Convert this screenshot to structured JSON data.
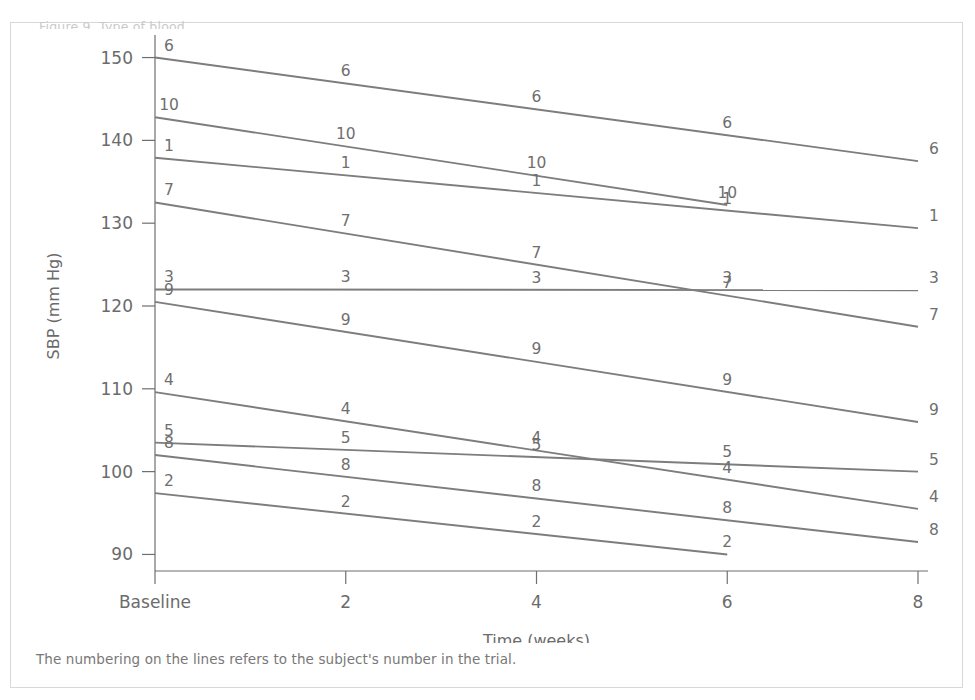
{
  "figure": {
    "top_clipped_caption": "Figure 9. Type of blood",
    "note": "The numbering on the lines refers to the subject's number in the trial."
  },
  "chart_data": {
    "type": "line",
    "title": "",
    "xlabel": "Time (weeks)",
    "ylabel": "SBP (mm Hg)",
    "x": [
      0,
      2,
      4,
      6,
      8
    ],
    "xtick_labels": [
      "Baseline",
      "2",
      "4",
      "6",
      "8"
    ],
    "ytick_labels": [
      "90",
      "100",
      "110",
      "120",
      "130",
      "140",
      "150"
    ],
    "yticks": [
      90,
      100,
      110,
      120,
      130,
      140,
      150
    ],
    "ylim": [
      88,
      152
    ],
    "xlim": [
      0,
      8
    ],
    "grid": false,
    "legend": "none",
    "line_color": "#7d7d7d",
    "label_position": "above-line at each measured x",
    "series": [
      {
        "name": "6",
        "label": "6",
        "x": [
          0,
          8
        ],
        "values": [
          150.0,
          137.5
        ]
      },
      {
        "name": "10",
        "label": "10",
        "x": [
          0,
          6
        ],
        "values": [
          142.8,
          132.2
        ]
      },
      {
        "name": "1",
        "label": "1",
        "x": [
          0,
          8
        ],
        "values": [
          137.9,
          129.4
        ]
      },
      {
        "name": "7",
        "label": "7",
        "x": [
          0,
          8
        ],
        "values": [
          132.5,
          117.5
        ]
      },
      {
        "name": "3",
        "label": "3",
        "x": [
          0,
          8
        ],
        "values": [
          122.0,
          121.9
        ]
      },
      {
        "name": "9",
        "label": "9",
        "x": [
          0,
          8
        ],
        "values": [
          120.5,
          106.0
        ]
      },
      {
        "name": "4",
        "label": "4",
        "x": [
          0,
          8
        ],
        "values": [
          109.6,
          95.5
        ]
      },
      {
        "name": "5",
        "label": "5",
        "x": [
          0,
          8
        ],
        "values": [
          103.5,
          100.0
        ]
      },
      {
        "name": "8",
        "label": "8",
        "x": [
          0,
          8
        ],
        "values": [
          102.0,
          91.5
        ]
      },
      {
        "name": "2",
        "label": "2",
        "x": [
          0,
          6
        ],
        "values": [
          97.4,
          90.0
        ]
      }
    ],
    "point_labels": [
      {
        "series": "6",
        "x": 0,
        "y": 150.0,
        "text": "6"
      },
      {
        "series": "6",
        "x": 2,
        "y": 146.9,
        "text": "6"
      },
      {
        "series": "6",
        "x": 4,
        "y": 143.8,
        "text": "6"
      },
      {
        "series": "6",
        "x": 6,
        "y": 140.6,
        "text": "6"
      },
      {
        "series": "6",
        "x": 8,
        "y": 137.5,
        "text": "6"
      },
      {
        "series": "10",
        "x": 0,
        "y": 142.8,
        "text": "10"
      },
      {
        "series": "10",
        "x": 2,
        "y": 139.3,
        "text": "10"
      },
      {
        "series": "10",
        "x": 4,
        "y": 135.8,
        "text": "10"
      },
      {
        "series": "10",
        "x": 6,
        "y": 132.2,
        "text": "10"
      },
      {
        "series": "1",
        "x": 0,
        "y": 137.9,
        "text": "1"
      },
      {
        "series": "1",
        "x": 2,
        "y": 135.8,
        "text": "1"
      },
      {
        "series": "1",
        "x": 4,
        "y": 133.7,
        "text": "1"
      },
      {
        "series": "1",
        "x": 6,
        "y": 131.5,
        "text": "1"
      },
      {
        "series": "1",
        "x": 8,
        "y": 129.4,
        "text": "1"
      },
      {
        "series": "7",
        "x": 0,
        "y": 132.5,
        "text": "7"
      },
      {
        "series": "7",
        "x": 2,
        "y": 128.8,
        "text": "7"
      },
      {
        "series": "7",
        "x": 4,
        "y": 125.0,
        "text": "7"
      },
      {
        "series": "7",
        "x": 6,
        "y": 121.3,
        "text": "7"
      },
      {
        "series": "7",
        "x": 8,
        "y": 117.5,
        "text": "7"
      },
      {
        "series": "3",
        "x": 0,
        "y": 122.0,
        "text": "3"
      },
      {
        "series": "3",
        "x": 2,
        "y": 122.0,
        "text": "3"
      },
      {
        "series": "3",
        "x": 4,
        "y": 121.9,
        "text": "3"
      },
      {
        "series": "3",
        "x": 6,
        "y": 121.9,
        "text": "3"
      },
      {
        "series": "3",
        "x": 8,
        "y": 121.9,
        "text": "3"
      },
      {
        "series": "9",
        "x": 0,
        "y": 120.5,
        "text": "9"
      },
      {
        "series": "9",
        "x": 2,
        "y": 116.9,
        "text": "9"
      },
      {
        "series": "9",
        "x": 4,
        "y": 113.3,
        "text": "9"
      },
      {
        "series": "9",
        "x": 6,
        "y": 109.6,
        "text": "9"
      },
      {
        "series": "9",
        "x": 8,
        "y": 106.0,
        "text": "9"
      },
      {
        "series": "4",
        "x": 0,
        "y": 109.6,
        "text": "4"
      },
      {
        "series": "4",
        "x": 2,
        "y": 106.1,
        "text": "4"
      },
      {
        "series": "4",
        "x": 4,
        "y": 102.6,
        "text": "4"
      },
      {
        "series": "4",
        "x": 6,
        "y": 99.0,
        "text": "4"
      },
      {
        "series": "4",
        "x": 8,
        "y": 95.5,
        "text": "4"
      },
      {
        "series": "5",
        "x": 0,
        "y": 103.5,
        "text": "5"
      },
      {
        "series": "5",
        "x": 2,
        "y": 102.6,
        "text": "5"
      },
      {
        "series": "5",
        "x": 4,
        "y": 101.8,
        "text": "5"
      },
      {
        "series": "5",
        "x": 6,
        "y": 100.9,
        "text": "5"
      },
      {
        "series": "5",
        "x": 8,
        "y": 100.0,
        "text": "5"
      },
      {
        "series": "8",
        "x": 0,
        "y": 102.0,
        "text": "8"
      },
      {
        "series": "8",
        "x": 2,
        "y": 99.4,
        "text": "8"
      },
      {
        "series": "8",
        "x": 4,
        "y": 96.8,
        "text": "8"
      },
      {
        "series": "8",
        "x": 6,
        "y": 94.1,
        "text": "8"
      },
      {
        "series": "8",
        "x": 8,
        "y": 91.5,
        "text": "8"
      },
      {
        "series": "2",
        "x": 0,
        "y": 97.4,
        "text": "2"
      },
      {
        "series": "2",
        "x": 2,
        "y": 94.9,
        "text": "2"
      },
      {
        "series": "2",
        "x": 4,
        "y": 92.5,
        "text": "2"
      },
      {
        "series": "2",
        "x": 6,
        "y": 90.0,
        "text": "2"
      }
    ]
  }
}
